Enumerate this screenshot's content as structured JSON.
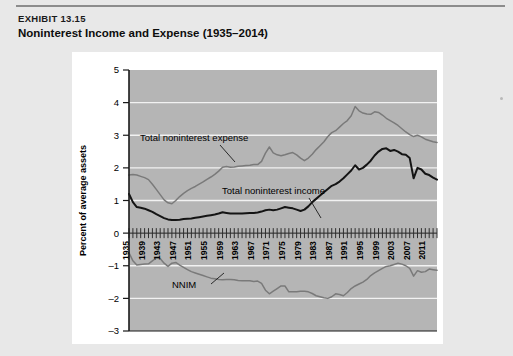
{
  "exhibit": {
    "label": "EXHIBIT 13.15",
    "title": "Noninterest Income and Expense (1935–2014)"
  },
  "colors": {
    "page_background": "#e8e8e8",
    "card_background": "#ffffff",
    "plot_background": "#b5b5b5",
    "gridline": "#f2f2f2",
    "axis": "#1a1a1a",
    "expense_line": "#7a7a7a",
    "income_line": "#141414",
    "nnim_line": "#7a7a7a"
  },
  "chart_data": {
    "type": "line",
    "title": "Noninterest Income and Expense (1935–2014)",
    "xlabel": "",
    "ylabel": "Percent of average assets",
    "xlim": [
      1935,
      2014
    ],
    "ylim": [
      -3,
      5
    ],
    "grid": true,
    "legend_position": "inline-annotations",
    "ytick_labels": [
      "5",
      "4",
      "3",
      "2",
      "1",
      "0",
      "–1",
      "–2",
      "–3"
    ],
    "ytick_values": [
      5,
      4,
      3,
      2,
      1,
      0,
      -1,
      -2,
      -3
    ],
    "xtick_labels": [
      "1935",
      "1939",
      "1943",
      "1947",
      "1951",
      "1955",
      "1959",
      "1963",
      "1967",
      "1971",
      "1975",
      "1979",
      "1983",
      "1987",
      "1991",
      "1995",
      "1999",
      "2003",
      "2007",
      "2011"
    ],
    "xtick_values": [
      1935,
      1939,
      1943,
      1947,
      1951,
      1955,
      1959,
      1963,
      1967,
      1971,
      1975,
      1979,
      1983,
      1987,
      1991,
      1995,
      1999,
      2003,
      2007,
      2011
    ],
    "x": [
      1935,
      1936,
      1937,
      1938,
      1939,
      1940,
      1941,
      1942,
      1943,
      1944,
      1945,
      1946,
      1947,
      1948,
      1949,
      1950,
      1951,
      1952,
      1953,
      1954,
      1955,
      1956,
      1957,
      1958,
      1959,
      1960,
      1961,
      1962,
      1963,
      1964,
      1965,
      1966,
      1967,
      1968,
      1969,
      1970,
      1971,
      1972,
      1973,
      1974,
      1975,
      1976,
      1977,
      1978,
      1979,
      1980,
      1981,
      1982,
      1983,
      1984,
      1985,
      1986,
      1987,
      1988,
      1989,
      1990,
      1991,
      1992,
      1993,
      1994,
      1995,
      1996,
      1997,
      1998,
      1999,
      2000,
      2001,
      2002,
      2003,
      2004,
      2005,
      2006,
      2007,
      2008,
      2009,
      2010,
      2011,
      2012,
      2013,
      2014
    ],
    "series": [
      {
        "name": "Total noninterest expense",
        "color": "#7a7a7a",
        "annotation": "Total noninterest  expense",
        "values": [
          1.78,
          1.8,
          1.78,
          1.74,
          1.7,
          1.64,
          1.5,
          1.34,
          1.18,
          1.02,
          0.93,
          0.9,
          1.0,
          1.12,
          1.22,
          1.3,
          1.37,
          1.43,
          1.5,
          1.57,
          1.65,
          1.72,
          1.8,
          1.9,
          2.02,
          2.04,
          2.02,
          2.03,
          2.05,
          2.06,
          2.07,
          2.08,
          2.1,
          2.1,
          2.2,
          2.45,
          2.64,
          2.46,
          2.4,
          2.37,
          2.4,
          2.44,
          2.47,
          2.4,
          2.3,
          2.22,
          2.3,
          2.42,
          2.56,
          2.68,
          2.8,
          2.96,
          3.08,
          3.14,
          3.25,
          3.36,
          3.45,
          3.6,
          3.88,
          3.75,
          3.68,
          3.65,
          3.64,
          3.72,
          3.7,
          3.62,
          3.52,
          3.45,
          3.38,
          3.3,
          3.2,
          3.1,
          3.02,
          2.96,
          3.0,
          2.95,
          2.88,
          2.84,
          2.8,
          2.78
        ]
      },
      {
        "name": "Total noninterest income",
        "color": "#141414",
        "annotation": "Total noninterest  income",
        "values": [
          1.2,
          0.95,
          0.8,
          0.78,
          0.75,
          0.7,
          0.65,
          0.58,
          0.52,
          0.46,
          0.42,
          0.4,
          0.4,
          0.41,
          0.43,
          0.44,
          0.45,
          0.47,
          0.49,
          0.51,
          0.53,
          0.55,
          0.57,
          0.6,
          0.64,
          0.62,
          0.6,
          0.6,
          0.6,
          0.6,
          0.61,
          0.62,
          0.62,
          0.63,
          0.66,
          0.7,
          0.72,
          0.7,
          0.72,
          0.76,
          0.8,
          0.78,
          0.76,
          0.72,
          0.68,
          0.72,
          0.82,
          0.95,
          1.05,
          1.15,
          1.25,
          1.35,
          1.45,
          1.5,
          1.58,
          1.68,
          1.8,
          1.92,
          2.08,
          1.95,
          2.0,
          2.1,
          2.22,
          2.38,
          2.5,
          2.58,
          2.6,
          2.52,
          2.55,
          2.5,
          2.42,
          2.4,
          2.3,
          1.68,
          2.0,
          1.95,
          1.82,
          1.78,
          1.7,
          1.64
        ]
      },
      {
        "name": "NNIM",
        "color": "#7a7a7a",
        "annotation": "NNIM",
        "values": [
          -0.6,
          -0.85,
          -0.98,
          -0.96,
          -0.95,
          -0.94,
          -0.85,
          -0.76,
          -0.78,
          -0.92,
          -1.02,
          -0.92,
          -0.9,
          -0.98,
          -1.05,
          -1.12,
          -1.18,
          -1.22,
          -1.26,
          -1.3,
          -1.34,
          -1.38,
          -1.4,
          -1.42,
          -1.43,
          -1.42,
          -1.42,
          -1.43,
          -1.45,
          -1.46,
          -1.46,
          -1.46,
          -1.48,
          -1.47,
          -1.54,
          -1.75,
          -1.86,
          -1.78,
          -1.7,
          -1.62,
          -1.62,
          -1.8,
          -1.8,
          -1.8,
          -1.78,
          -1.78,
          -1.8,
          -1.85,
          -1.92,
          -1.95,
          -1.98,
          -2.0,
          -1.95,
          -1.86,
          -1.88,
          -1.92,
          -1.82,
          -1.7,
          -1.62,
          -1.56,
          -1.5,
          -1.42,
          -1.3,
          -1.22,
          -1.15,
          -1.08,
          -1.02,
          -1.0,
          -0.96,
          -0.92,
          -0.95,
          -1.0,
          -1.08,
          -1.32,
          -1.15,
          -1.2,
          -1.18,
          -1.1,
          -1.12,
          -1.14
        ]
      }
    ]
  }
}
